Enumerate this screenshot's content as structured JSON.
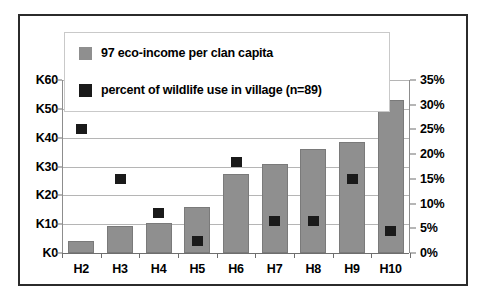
{
  "chart_data": {
    "type": "bar",
    "title": "",
    "subtitle": "",
    "xlabel": "",
    "ylabel": "",
    "grid": true,
    "legend_position": "top-inside",
    "categories": [
      "H2",
      "H3",
      "H4",
      "H5",
      "H6",
      "H7",
      "H8",
      "H9",
      "H10"
    ],
    "axes": {
      "left": {
        "label": "",
        "ticks": [
          "K0",
          "K10",
          "K20",
          "K30",
          "K40",
          "K50",
          "K60"
        ],
        "tick_values": [
          0,
          10,
          20,
          30,
          40,
          50,
          60
        ],
        "min": 0,
        "max": 60,
        "unit_prefix": "K"
      },
      "right": {
        "label": "",
        "ticks": [
          "0%",
          "5%",
          "10%",
          "15%",
          "20%",
          "25%",
          "30%",
          "35%"
        ],
        "tick_values": [
          0,
          5,
          10,
          15,
          20,
          25,
          30,
          35
        ],
        "min": 0,
        "max": 35,
        "unit_suffix": "%"
      }
    },
    "series": [
      {
        "name": "97 eco-income per clan capita",
        "type": "bar",
        "axis": "left",
        "color": "#8f8f8f",
        "values": [
          4,
          9.5,
          10.5,
          16,
          27.5,
          31,
          36,
          38.5,
          53
        ]
      },
      {
        "name": "percent of wildlife use in village (n=89)",
        "type": "scatter",
        "axis": "right",
        "color": "#1a1a1a",
        "values": [
          25,
          15,
          8,
          2.5,
          18.5,
          6.5,
          6.5,
          15,
          4.5
        ]
      }
    ]
  },
  "legend": {
    "entries": [
      {
        "label": "97 eco-income per clan capita",
        "color": "#8f8f8f"
      },
      {
        "label": "percent of wildlife use in village (n=89)",
        "color": "#1a1a1a"
      }
    ]
  },
  "colors": {
    "bar_fill": "#8f8f8f",
    "marker_fill": "#1a1a1a",
    "frame": "#2b2b2b",
    "gridline": "#b5b5b5",
    "background": "#ffffff"
  }
}
